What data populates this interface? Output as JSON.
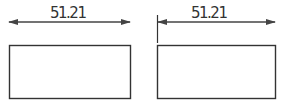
{
  "figures": [
    {
      "name": "left",
      "dimension_label": "51.21",
      "arrow": {
        "x1": 8,
        "x2": 131,
        "y": 22,
        "style": "both-ends"
      },
      "extension_line": null,
      "rect": {
        "x": 9,
        "y": 45,
        "w": 122,
        "h": 53
      }
    },
    {
      "name": "right",
      "dimension_label": "51.21",
      "arrow": {
        "x1": 157,
        "x2": 276,
        "y": 22,
        "style": "both-ends"
      },
      "extension_line": {
        "x": 157,
        "y1": 15,
        "y2": 43
      },
      "rect": {
        "x": 157,
        "y": 45,
        "w": 119,
        "h": 53
      }
    }
  ],
  "colors": {
    "line": "#333333",
    "arrow": "#444444",
    "background": "#ffffff"
  }
}
